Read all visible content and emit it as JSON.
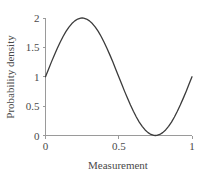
{
  "chart_data": {
    "type": "line",
    "title": "",
    "xlabel": "Measurement",
    "ylabel": "Probability density",
    "xlim": [
      0,
      1
    ],
    "ylim": [
      0,
      2
    ],
    "grid": false,
    "legend": false,
    "curve_color": "#3b3b3b",
    "axis_color": "#9a9a9a",
    "background": "#ffffff",
    "function": "1 + sin(2*pi*x)",
    "xticks": [
      0,
      0.5,
      1
    ],
    "xticklabels": [
      "0",
      "0.5",
      "1"
    ],
    "yticks": [
      0,
      0.5,
      1,
      1.5,
      2
    ],
    "yticklabels": [
      "0",
      "0.5",
      "1",
      "1.5",
      "2"
    ],
    "series": [
      {
        "name": "probability density",
        "x": [
          0,
          0.02,
          0.04,
          0.06,
          0.08,
          0.1,
          0.12,
          0.14,
          0.16,
          0.18,
          0.2,
          0.22,
          0.24,
          0.25,
          0.26,
          0.28,
          0.3,
          0.32,
          0.34,
          0.36,
          0.38,
          0.4,
          0.42,
          0.44,
          0.46,
          0.48,
          0.5,
          0.52,
          0.54,
          0.56,
          0.58,
          0.6,
          0.62,
          0.64,
          0.66,
          0.68,
          0.7,
          0.72,
          0.74,
          0.75,
          0.76,
          0.78,
          0.8,
          0.82,
          0.84,
          0.86,
          0.88,
          0.9,
          0.92,
          0.94,
          0.96,
          0.98,
          1
        ],
        "y": [
          1.0,
          1.125,
          1.249,
          1.368,
          1.482,
          1.588,
          1.685,
          1.771,
          1.844,
          1.905,
          1.951,
          1.982,
          1.998,
          2.0,
          1.998,
          1.982,
          1.951,
          1.905,
          1.844,
          1.771,
          1.685,
          1.588,
          1.482,
          1.368,
          1.249,
          1.125,
          1.0,
          0.875,
          0.751,
          0.632,
          0.518,
          0.412,
          0.315,
          0.229,
          0.156,
          0.095,
          0.049,
          0.018,
          0.002,
          0.0,
          0.002,
          0.018,
          0.049,
          0.095,
          0.156,
          0.229,
          0.315,
          0.412,
          0.518,
          0.632,
          0.751,
          0.875,
          1.0
        ]
      }
    ]
  },
  "axes": {
    "x_label": "Measurement",
    "y_label": "Probability density"
  }
}
